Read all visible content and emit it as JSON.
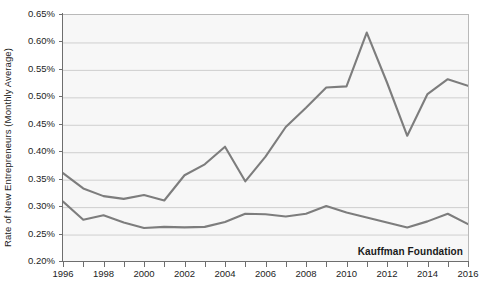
{
  "chart_data": {
    "type": "line",
    "title": "",
    "xlabel": "",
    "ylabel": "Rate of New Entrepreneurs (Monthly Average)",
    "xlim": [
      1996,
      2016
    ],
    "ylim": [
      0.2,
      0.65
    ],
    "y_tick_step": 0.05,
    "y_unit": "%",
    "grid": true,
    "legend_position": "none",
    "annotations": [
      "Kauffman Foundation"
    ],
    "y_ticks": [
      "0.65%",
      "0.60%",
      "0.55%",
      "0.50%",
      "0.45%",
      "0.40%",
      "0.35%",
      "0.30%",
      "0.25%",
      "0.20%"
    ],
    "y_tick_values": [
      0.65,
      0.6,
      0.55,
      0.5,
      0.45,
      0.4,
      0.35,
      0.3,
      0.25,
      0.2
    ],
    "x_ticks": [
      "1996",
      "1998",
      "2000",
      "2002",
      "2004",
      "2006",
      "2008",
      "2010",
      "2012",
      "2014",
      "2016"
    ],
    "x_tick_values": [
      1996,
      1998,
      2000,
      2002,
      2004,
      2006,
      2008,
      2010,
      2012,
      2014,
      2016
    ],
    "x_all_years": [
      1996,
      1997,
      1998,
      1999,
      2000,
      2001,
      2002,
      2003,
      2004,
      2005,
      2006,
      2007,
      2008,
      2009,
      2010,
      2011,
      2012,
      2013,
      2014,
      2015,
      2016
    ],
    "series": [
      {
        "name": "upper-line",
        "color": "#7d7d7d",
        "values": [
          0.362,
          0.334,
          0.32,
          0.315,
          0.322,
          0.312,
          0.358,
          0.378,
          0.41,
          0.347,
          0.392,
          0.446,
          0.481,
          0.518,
          0.52,
          0.618,
          0.527,
          0.43,
          0.506,
          0.533,
          0.521
        ]
      },
      {
        "name": "lower-line",
        "color": "#7d7d7d",
        "values": [
          0.31,
          0.277,
          0.285,
          0.272,
          0.262,
          0.264,
          0.263,
          0.264,
          0.273,
          0.288,
          0.287,
          0.283,
          0.288,
          0.302,
          0.29,
          0.281,
          0.272,
          0.263,
          0.274,
          0.288,
          0.269
        ]
      }
    ]
  },
  "watermark": {
    "text": "Kauffman Foundation"
  }
}
